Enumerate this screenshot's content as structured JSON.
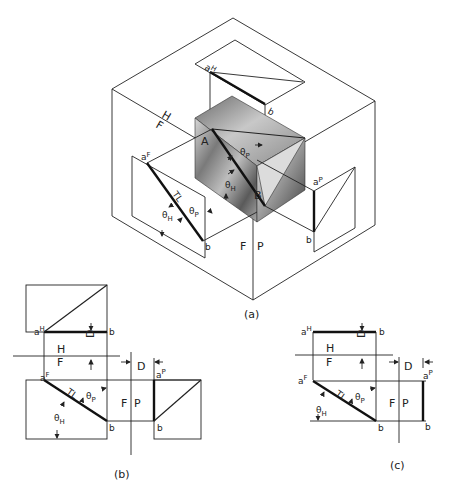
{
  "figure": {
    "panels": [
      {
        "id": "a",
        "caption": "(a)",
        "description": "Pictorial glass-box view of line AB in a rectangular prism",
        "labels": {
          "point_a_pictorial": "A",
          "point_b_pictorial": "B",
          "hf_upper": "H",
          "hf_lower": "F",
          "fp_left": "F",
          "fp_right": "P",
          "top_a": "a",
          "top_a_sup": "H",
          "top_b": "b",
          "front_a": "a",
          "front_a_sup": "F",
          "front_b": "b",
          "front_tl": "TL",
          "front_theta_h": "θ",
          "front_theta_h_sub": "H",
          "front_theta_p": "θ",
          "front_theta_p_sub": "P",
          "box_theta_h": "θ",
          "box_theta_h_sub": "H",
          "box_theta_p": "θ",
          "box_theta_p_sub": "P",
          "side_a": "a",
          "side_a_sup": "P",
          "side_b": "b"
        }
      },
      {
        "id": "b",
        "caption": "(b)",
        "description": "Orthographic views with projection boxes",
        "labels": {
          "top_a": "a",
          "top_a_sup": "H",
          "top_b": "b",
          "depth_d": "D",
          "hf_upper": "H",
          "hf_lower": "F",
          "front_a": "a",
          "front_a_sup": "F",
          "front_b": "b",
          "tl": "TL",
          "theta_p": "θ",
          "theta_p_sub": "P",
          "theta_h": "θ",
          "theta_h_sub": "H",
          "fp_left": "F",
          "fp_right": "P",
          "side_depth_d": "D",
          "side_a": "a",
          "side_a_sup": "P",
          "side_b": "b"
        }
      },
      {
        "id": "c",
        "caption": "(c)",
        "description": "Orthographic views without enclosing boxes",
        "labels": {
          "top_a": "a",
          "top_a_sup": "H",
          "top_b": "b",
          "depth_d": "D",
          "hf_upper": "H",
          "hf_lower": "F",
          "front_a": "a",
          "front_a_sup": "F",
          "front_b": "b",
          "tl": "TL",
          "theta_p": "θ",
          "theta_p_sub": "P",
          "theta_h": "θ",
          "theta_h_sub": "H",
          "fp_left": "F",
          "fp_right": "P",
          "side_depth_d": "D",
          "side_a": "a",
          "side_a_sup": "P",
          "side_b": "b"
        }
      }
    ]
  }
}
